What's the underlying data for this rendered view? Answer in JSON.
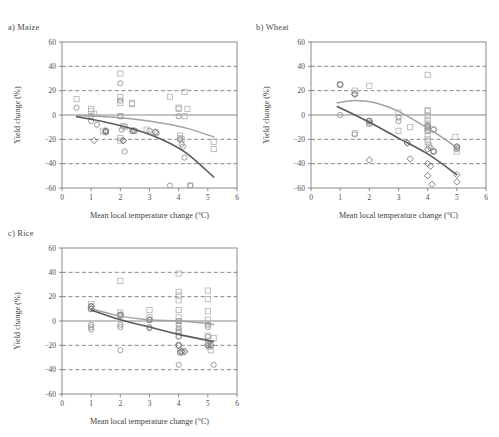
{
  "figure": {
    "panels": [
      {
        "id": "maize",
        "title": "a) Maize",
        "x": 8,
        "y": 22
      },
      {
        "id": "wheat",
        "title": "b) Wheat",
        "x": 256,
        "y": 22
      },
      {
        "id": "rice",
        "title": "c) Rice",
        "x": 8,
        "y": 228
      }
    ],
    "axis": {
      "xlabel": "Mean local temperature change (°C)",
      "ylabel": "Yield change (%)",
      "xticks": [
        "0",
        "1",
        "2",
        "3",
        "4",
        "5",
        "6"
      ],
      "yticks": [
        "60",
        "40",
        "20",
        "0",
        "−20",
        "−40",
        "−60"
      ],
      "xlim": [
        0,
        6
      ],
      "ylim": [
        -60,
        60
      ],
      "gridlines_y": [
        40,
        20,
        -20,
        -40
      ],
      "zero_line_y": 0
    },
    "colors": {
      "frame": "#6f6f6f",
      "grid": "#555555",
      "zero": "#8a8a8a",
      "curve_light": "#9aa79a",
      "curve_dark": "#5a5a5a",
      "marker_square": "#b4b4b4",
      "marker_circle": "#8e8e8e",
      "marker_diamond": "#707070",
      "text": "#3f3f3f"
    }
  },
  "chart_data": [
    {
      "type": "scatter",
      "id": "maize",
      "title": "a) Maize",
      "xlabel": "Mean local temperature change (°C)",
      "ylabel": "Yield change (%)",
      "xlim": [
        0,
        6
      ],
      "ylim": [
        -60,
        60
      ],
      "grid": true,
      "legend": "none",
      "series": [
        {
          "name": "square-markers",
          "marker": "square",
          "color": "#b4b4b4",
          "points": [
            [
              0.5,
              13
            ],
            [
              1.0,
              3
            ],
            [
              1.0,
              5
            ],
            [
              1.1,
              1
            ],
            [
              1.4,
              -13
            ],
            [
              1.5,
              -14
            ],
            [
              2.0,
              34
            ],
            [
              2.0,
              15
            ],
            [
              2.0,
              10
            ],
            [
              2.0,
              -1
            ],
            [
              2.0,
              -19
            ],
            [
              2.0,
              -21
            ],
            [
              2.1,
              -9
            ],
            [
              2.15,
              -10
            ],
            [
              2.4,
              10
            ],
            [
              2.4,
              9
            ],
            [
              2.45,
              -13
            ],
            [
              2.9,
              -12
            ],
            [
              3.2,
              -14
            ],
            [
              3.7,
              15
            ],
            [
              4.0,
              5
            ],
            [
              4.0,
              6
            ],
            [
              4.05,
              -17
            ],
            [
              4.05,
              -19
            ],
            [
              4.1,
              -20
            ],
            [
              4.2,
              19
            ],
            [
              4.2,
              -1
            ],
            [
              4.3,
              5
            ],
            [
              4.4,
              -58
            ],
            [
              5.2,
              -22
            ],
            [
              5.2,
              -28
            ]
          ]
        },
        {
          "name": "circle-markers",
          "marker": "circle",
          "color": "#8e8e8e",
          "points": [
            [
              0.5,
              6
            ],
            [
              1.0,
              -5
            ],
            [
              1.0,
              -1
            ],
            [
              1.2,
              -8
            ],
            [
              1.5,
              -13
            ],
            [
              2.0,
              26
            ],
            [
              2.0,
              12
            ],
            [
              2.0,
              -1
            ],
            [
              2.05,
              -12
            ],
            [
              2.1,
              -21
            ],
            [
              2.15,
              -30
            ],
            [
              2.4,
              -13
            ],
            [
              2.5,
              -13
            ],
            [
              3.0,
              -13
            ],
            [
              3.25,
              -15
            ],
            [
              3.7,
              -58
            ],
            [
              4.0,
              -1
            ],
            [
              4.05,
              -20
            ],
            [
              4.1,
              -24
            ],
            [
              4.15,
              -26
            ],
            [
              4.2,
              -35
            ],
            [
              4.4,
              -58
            ]
          ]
        },
        {
          "name": "diamond-markers",
          "marker": "diamond",
          "color": "#707070",
          "points": [
            [
              1.1,
              -21
            ],
            [
              1.5,
              -13
            ],
            [
              1.5,
              -14
            ],
            [
              2.1,
              -21
            ],
            [
              2.45,
              -13
            ],
            [
              3.2,
              -14
            ]
          ]
        }
      ],
      "fit_curves": [
        {
          "name": "with-adaptation",
          "color": "#9aa79a",
          "points": [
            [
              0.5,
              -0.5
            ],
            [
              1.5,
              -1.5
            ],
            [
              2.5,
              -3.5
            ],
            [
              3.5,
              -7
            ],
            [
              4.3,
              -11
            ],
            [
              5.2,
              -18
            ]
          ]
        },
        {
          "name": "without-adaptation",
          "color": "#5a5a5a",
          "points": [
            [
              0.5,
              -1.5
            ],
            [
              1.5,
              -6
            ],
            [
              2.5,
              -12
            ],
            [
              3.5,
              -21
            ],
            [
              4.3,
              -32
            ],
            [
              5.2,
              -51
            ]
          ]
        }
      ]
    },
    {
      "type": "scatter",
      "id": "wheat",
      "title": "b) Wheat",
      "xlabel": "Mean local temperature change (°C)",
      "ylabel": "Yield change (%)",
      "xlim": [
        0,
        6
      ],
      "ylim": [
        -60,
        60
      ],
      "grid": true,
      "legend": "none",
      "series": [
        {
          "name": "square-markers",
          "marker": "square",
          "color": "#b4b4b4",
          "points": [
            [
              1.0,
              25
            ],
            [
              1.5,
              20
            ],
            [
              1.5,
              18
            ],
            [
              1.5,
              -15
            ],
            [
              2.0,
              24
            ],
            [
              2.0,
              -5
            ],
            [
              2.0,
              -7
            ],
            [
              3.0,
              -13
            ],
            [
              3.0,
              2
            ],
            [
              3.4,
              -10
            ],
            [
              4.0,
              33
            ],
            [
              4.0,
              4
            ],
            [
              4.0,
              3
            ],
            [
              4.0,
              -1
            ],
            [
              4.0,
              -4
            ],
            [
              4.0,
              -7
            ],
            [
              4.0,
              -10
            ],
            [
              4.0,
              -13
            ],
            [
              4.0,
              -17
            ],
            [
              4.0,
              -20
            ],
            [
              4.0,
              -22
            ],
            [
              4.05,
              -25
            ],
            [
              4.2,
              -12
            ],
            [
              4.2,
              -30
            ],
            [
              4.95,
              -18
            ],
            [
              5.0,
              -27
            ],
            [
              5.0,
              -30
            ]
          ]
        },
        {
          "name": "circle-markers",
          "marker": "circle",
          "color": "#8e8e8e",
          "points": [
            [
              1.0,
              25
            ],
            [
              1.0,
              0
            ],
            [
              1.5,
              17
            ],
            [
              1.5,
              -16
            ],
            [
              2.0,
              -5
            ],
            [
              2.0,
              -7
            ],
            [
              3.0,
              -5
            ],
            [
              3.3,
              -23
            ],
            [
              4.0,
              -9
            ],
            [
              4.0,
              -11
            ],
            [
              4.0,
              -13
            ],
            [
              4.1,
              -27
            ],
            [
              4.2,
              -30
            ],
            [
              5.0,
              -26
            ],
            [
              5.0,
              -28
            ]
          ]
        },
        {
          "name": "diamond-markers",
          "marker": "diamond",
          "color": "#707070",
          "points": [
            [
              1.0,
              25
            ],
            [
              1.5,
              17
            ],
            [
              2.0,
              -5
            ],
            [
              2.0,
              -37
            ],
            [
              3.0,
              -2
            ],
            [
              3.3,
              -23
            ],
            [
              3.4,
              -36
            ],
            [
              4.0,
              -9
            ],
            [
              4.0,
              -28
            ],
            [
              4.0,
              -40
            ],
            [
              4.0,
              -50
            ],
            [
              4.1,
              -42
            ],
            [
              4.15,
              -57
            ],
            [
              4.2,
              -12
            ],
            [
              4.2,
              -30
            ],
            [
              5.0,
              -26
            ],
            [
              5.0,
              -49
            ],
            [
              5.0,
              -55
            ]
          ]
        }
      ],
      "fit_curves": [
        {
          "name": "with-adaptation",
          "color": "#9aa79a",
          "points": [
            [
              0.9,
              10
            ],
            [
              1.5,
              12
            ],
            [
              2.2,
              10
            ],
            [
              3.0,
              3
            ],
            [
              3.8,
              -8
            ],
            [
              4.6,
              -20
            ],
            [
              5.0,
              -27
            ]
          ]
        },
        {
          "name": "without-adaptation",
          "color": "#5a5a5a",
          "points": [
            [
              0.9,
              7
            ],
            [
              2.0,
              -6
            ],
            [
              3.0,
              -19
            ],
            [
              4.0,
              -32
            ],
            [
              5.0,
              -49
            ]
          ]
        }
      ]
    },
    {
      "type": "scatter",
      "id": "rice",
      "title": "c) Rice",
      "xlabel": "Mean local temperature change (°C)",
      "ylabel": "Yield change (%)",
      "xlim": [
        0,
        6
      ],
      "ylim": [
        -60,
        60
      ],
      "grid": true,
      "legend": "none",
      "series": [
        {
          "name": "square-markers",
          "marker": "square",
          "color": "#b4b4b4",
          "points": [
            [
              1.0,
              14
            ],
            [
              1.0,
              12
            ],
            [
              1.0,
              10
            ],
            [
              2.0,
              33
            ],
            [
              2.0,
              7
            ],
            [
              2.0,
              5
            ],
            [
              2.0,
              4
            ],
            [
              3.0,
              9
            ],
            [
              3.0,
              3
            ],
            [
              3.0,
              1
            ],
            [
              4.0,
              39
            ],
            [
              4.0,
              24
            ],
            [
              4.0,
              21
            ],
            [
              4.0,
              17
            ],
            [
              4.0,
              9
            ],
            [
              4.0,
              3
            ],
            [
              4.0,
              0
            ],
            [
              4.0,
              -8
            ],
            [
              4.0,
              -12
            ],
            [
              4.0,
              -20
            ],
            [
              4.05,
              -25
            ],
            [
              4.1,
              -26
            ],
            [
              5.0,
              25
            ],
            [
              5.0,
              18
            ],
            [
              5.0,
              8
            ],
            [
              5.0,
              1
            ],
            [
              5.0,
              -12
            ],
            [
              5.0,
              -19
            ],
            [
              5.05,
              -21
            ],
            [
              5.1,
              -24
            ],
            [
              5.2,
              -14
            ]
          ]
        },
        {
          "name": "circle-markers",
          "marker": "circle",
          "color": "#8e8e8e",
          "points": [
            [
              1.0,
              12
            ],
            [
              1.0,
              -3
            ],
            [
              1.0,
              -5
            ],
            [
              1.0,
              -7
            ],
            [
              2.0,
              5
            ],
            [
              2.0,
              -3
            ],
            [
              2.0,
              -5
            ],
            [
              2.0,
              -24
            ],
            [
              3.0,
              1
            ],
            [
              3.0,
              -5
            ],
            [
              3.0,
              -6
            ],
            [
              4.0,
              0
            ],
            [
              4.0,
              -3
            ],
            [
              4.0,
              -6
            ],
            [
              4.0,
              -9
            ],
            [
              4.0,
              -13
            ],
            [
              4.0,
              -20
            ],
            [
              4.05,
              -26
            ],
            [
              4.1,
              -25
            ],
            [
              4.2,
              -25
            ],
            [
              4.0,
              -36
            ],
            [
              5.0,
              -3
            ],
            [
              5.0,
              -5
            ],
            [
              5.0,
              -13
            ],
            [
              5.0,
              -20
            ],
            [
              5.1,
              -20
            ],
            [
              5.2,
              -36
            ]
          ]
        },
        {
          "name": "diamond-markers",
          "marker": "diamond",
          "color": "#707070",
          "points": [
            [
              1.0,
              12
            ],
            [
              1.0,
              10
            ],
            [
              2.0,
              5
            ],
            [
              3.0,
              1
            ],
            [
              4.0,
              -20
            ],
            [
              4.1,
              -25
            ],
            [
              4.2,
              -25
            ],
            [
              5.0,
              -20
            ],
            [
              5.1,
              -20
            ]
          ]
        }
      ],
      "fit_curves": [
        {
          "name": "with-adaptation",
          "color": "#9aa79a",
          "points": [
            [
              1.0,
              10
            ],
            [
              2.0,
              4
            ],
            [
              3.0,
              1
            ],
            [
              4.0,
              0
            ],
            [
              5.0,
              -2
            ],
            [
              5.2,
              -3
            ]
          ]
        },
        {
          "name": "without-adaptation",
          "color": "#5a5a5a",
          "points": [
            [
              1.0,
              9
            ],
            [
              2.0,
              1
            ],
            [
              3.0,
              -5
            ],
            [
              4.0,
              -11
            ],
            [
              5.0,
              -16
            ],
            [
              5.2,
              -17
            ]
          ]
        }
      ]
    }
  ]
}
